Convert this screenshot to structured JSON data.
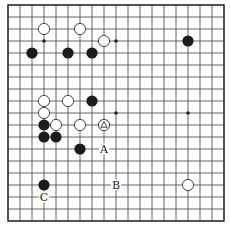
{
  "board": {
    "size": 19,
    "origin_x": 8,
    "origin_y": 5,
    "spacing": 12,
    "stone_radius": 5.6,
    "colors": {
      "line": "#555555",
      "black": "#1c1c1c",
      "white": "#ffffff",
      "background": "#ffffff"
    }
  },
  "star_points": [
    [
      3,
      3
    ],
    [
      9,
      3
    ],
    [
      15,
      3
    ],
    [
      3,
      9
    ],
    [
      9,
      9
    ],
    [
      15,
      9
    ],
    [
      3,
      15
    ],
    [
      9,
      15
    ],
    [
      15,
      15
    ]
  ],
  "stones": [
    {
      "color": "white",
      "col": 3,
      "row": 2
    },
    {
      "color": "white",
      "col": 6,
      "row": 2
    },
    {
      "color": "white",
      "col": 8,
      "row": 3
    },
    {
      "color": "black",
      "col": 15,
      "row": 3
    },
    {
      "color": "black",
      "col": 2,
      "row": 4
    },
    {
      "color": "black",
      "col": 5,
      "row": 4
    },
    {
      "color": "black",
      "col": 7,
      "row": 4
    },
    {
      "color": "white",
      "col": 3,
      "row": 8
    },
    {
      "color": "white",
      "col": 5,
      "row": 8
    },
    {
      "color": "black",
      "col": 7,
      "row": 8
    },
    {
      "color": "white",
      "col": 3,
      "row": 9
    },
    {
      "color": "black",
      "col": 3,
      "row": 10
    },
    {
      "color": "white",
      "col": 4,
      "row": 10
    },
    {
      "color": "white",
      "col": 6,
      "row": 10
    },
    {
      "color": "white",
      "col": 8,
      "row": 10,
      "marker": "triangle"
    },
    {
      "color": "black",
      "col": 3,
      "row": 11
    },
    {
      "color": "black",
      "col": 4,
      "row": 11
    },
    {
      "color": "black",
      "col": 6,
      "row": 12
    },
    {
      "color": "black",
      "col": 3,
      "row": 15
    },
    {
      "color": "white",
      "col": 15,
      "row": 15
    }
  ],
  "labels": [
    {
      "text": "A",
      "col": 8,
      "row": 12
    },
    {
      "text": "B",
      "col": 9,
      "row": 15
    },
    {
      "text": "C",
      "col": 3,
      "row": 16
    }
  ]
}
